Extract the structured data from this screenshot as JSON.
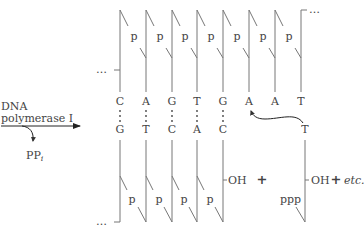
{
  "enzyme": {
    "line1": "DNA",
    "line2": "polymerase I",
    "byproduct": "PP",
    "byproduct_sub": "i"
  },
  "template_strand": {
    "bases": [
      "C",
      "A",
      "G",
      "T",
      "G",
      "A",
      "A",
      "T"
    ],
    "phosphate_label": "p",
    "continuation": "…"
  },
  "new_strand": {
    "bases": [
      "G",
      "T",
      "C",
      "A",
      "C"
    ],
    "phosphate_label": "p",
    "end_group": "OH",
    "continuation": "…"
  },
  "incoming_nucleotide": {
    "base": "T",
    "triphosphate": "ppp",
    "end_group": "OH",
    "pairs_with": "A"
  },
  "operators": {
    "plus": "+",
    "plus2": "+",
    "etc": "etc."
  }
}
